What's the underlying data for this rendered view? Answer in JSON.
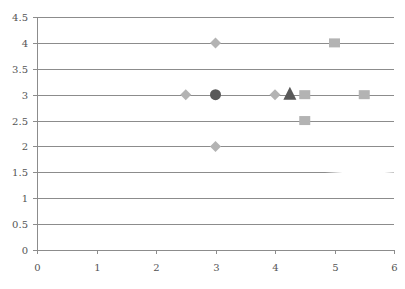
{
  "chart_data": {
    "type": "scatter",
    "title": "",
    "xlabel": "",
    "ylabel": "",
    "xlim": [
      0,
      6
    ],
    "ylim": [
      0,
      4.5
    ],
    "x_ticks": [
      "0",
      "1",
      "2",
      "3",
      "4",
      "5",
      "6"
    ],
    "y_ticks": [
      "0",
      "0.5",
      "1",
      "1.5",
      "2",
      "2.5",
      "3",
      "3.5",
      "4",
      "4.5"
    ],
    "grid": "horizontal",
    "legend": null,
    "series": [
      {
        "name": "diamonds",
        "marker": "diamond",
        "color": "#b3b3b3",
        "points": [
          [
            3,
            4
          ],
          [
            2.5,
            3
          ],
          [
            4,
            3
          ],
          [
            3,
            2
          ]
        ]
      },
      {
        "name": "circle",
        "marker": "circle",
        "color": "#595959",
        "points": [
          [
            3,
            3
          ]
        ]
      },
      {
        "name": "triangle",
        "marker": "triangle",
        "color": "#595959",
        "points": [
          [
            4.25,
            3
          ]
        ]
      },
      {
        "name": "squares",
        "marker": "square",
        "color": "#b3b3b3",
        "points": [
          [
            5,
            4
          ],
          [
            4.5,
            3
          ],
          [
            5.5,
            3
          ],
          [
            4.5,
            2.5
          ]
        ]
      }
    ]
  },
  "style": {
    "grid_color": "#8c8c8c",
    "axis_color": "#8c8c8c",
    "label_color": "#555555"
  }
}
